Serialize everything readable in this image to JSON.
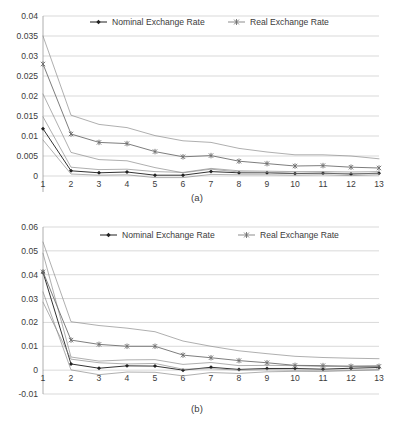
{
  "figure": {
    "caption_a": "(a)",
    "caption_b": "(b)"
  },
  "legend": {
    "nominal_label": "Nominal Exchange Rate",
    "real_label": "Real Exchange Rate",
    "nominal_marker": "diamond-marker-icon",
    "real_marker": "cross-marker-icon"
  },
  "colors": {
    "nominal": "#333333",
    "real": "#6e6e6e",
    "band": "#8d8d8d",
    "grid": "#c8c8c8",
    "axis": "#9a9a9a",
    "text": "#3b3b3b",
    "background": "#ffffff"
  },
  "chart_data": [
    {
      "type": "line",
      "panel": "a",
      "title": "",
      "xlabel": "",
      "ylabel": "",
      "grid": true,
      "legend_position": "top-center",
      "x": [
        1,
        2,
        3,
        4,
        5,
        6,
        7,
        8,
        9,
        10,
        11,
        12,
        13
      ],
      "xticks": [
        "1",
        "2",
        "3",
        "4",
        "5",
        "6",
        "7",
        "8",
        "9",
        "10",
        "11",
        "12",
        "13"
      ],
      "yticks": [
        "0.04",
        "0.035",
        "0.03",
        "0.025",
        "0.02",
        "0.015",
        "0.01",
        "0.005",
        "0",
        "-0.005"
      ],
      "ytick_values": [
        0.04,
        0.035,
        0.03,
        0.025,
        0.02,
        0.015,
        0.01,
        0.005,
        0,
        -0.005
      ],
      "ylim": [
        -0.005,
        0.04
      ],
      "xlim": [
        1,
        13
      ],
      "series": [
        {
          "name": "Nominal Exchange Rate",
          "marker": "diamond",
          "values": [
            0.0118,
            0.0013,
            0.0008,
            0.001,
            0.0002,
            0.0002,
            0.0011,
            0.0008,
            0.0008,
            0.0006,
            0.0007,
            0.0005,
            0.0007
          ]
        },
        {
          "name": "Nominal upper band",
          "marker": "none",
          "values": [
            0.0148,
            0.0022,
            0.0016,
            0.0017,
            0.0011,
            0.0009,
            0.0019,
            0.0013,
            0.0012,
            0.0011,
            0.0011,
            0.001,
            0.0011
          ]
        },
        {
          "name": "Nominal lower band",
          "marker": "none",
          "values": [
            0.009,
            0.0005,
            0.0002,
            0.0003,
            -0.0004,
            -0.0004,
            0.0004,
            0.0003,
            0.0003,
            0.0002,
            0.0003,
            0.0001,
            0.0003
          ]
        },
        {
          "name": "Real Exchange Rate",
          "marker": "cross",
          "values": [
            0.028,
            0.0105,
            0.0084,
            0.0081,
            0.0061,
            0.0048,
            0.0051,
            0.0037,
            0.0031,
            0.0025,
            0.0026,
            0.0022,
            0.002
          ]
        },
        {
          "name": "Real upper band",
          "marker": "none",
          "values": [
            0.035,
            0.0152,
            0.0129,
            0.0121,
            0.0101,
            0.0088,
            0.0084,
            0.0069,
            0.006,
            0.0053,
            0.0053,
            0.005,
            0.0043
          ]
        },
        {
          "name": "Real lower band",
          "marker": "none",
          "values": [
            0.0205,
            0.0059,
            0.0041,
            0.0038,
            0.0021,
            0.0008,
            0.0017,
            0.001,
            0.0009,
            0.0007,
            0.0007,
            0.0006,
            0.0006
          ]
        }
      ]
    },
    {
      "type": "line",
      "panel": "b",
      "title": "",
      "xlabel": "",
      "ylabel": "",
      "grid": true,
      "legend_position": "top-center",
      "x": [
        1,
        2,
        3,
        4,
        5,
        6,
        7,
        8,
        9,
        10,
        11,
        12,
        13
      ],
      "xticks": [
        "1",
        "2",
        "3",
        "4",
        "5",
        "6",
        "7",
        "8",
        "9",
        "10",
        "11",
        "12",
        "13"
      ],
      "yticks": [
        "0.06",
        "0.05",
        "0.04",
        "0.03",
        "0.02",
        "0.01",
        "0",
        "-0.01"
      ],
      "ytick_values": [
        0.06,
        0.05,
        0.04,
        0.03,
        0.02,
        0.01,
        0,
        -0.01
      ],
      "ylim": [
        -0.01,
        0.06
      ],
      "xlim": [
        1,
        13
      ],
      "series": [
        {
          "name": "Nominal Exchange Rate",
          "marker": "diamond",
          "values": [
            0.041,
            0.0026,
            0.0008,
            0.0018,
            0.0017,
            0.0,
            0.0012,
            0.0003,
            0.0007,
            0.0007,
            0.0004,
            0.0008,
            0.0011
          ]
        },
        {
          "name": "Nominal upper band",
          "marker": "none",
          "values": [
            0.049,
            0.0055,
            0.0038,
            0.0043,
            0.0044,
            0.0024,
            0.0032,
            0.0019,
            0.002,
            0.0019,
            0.0015,
            0.0017,
            0.0019
          ]
        },
        {
          "name": "Nominal lower band",
          "marker": "none",
          "values": [
            0.0328,
            0.0001,
            -0.0019,
            -0.0008,
            -0.0009,
            -0.0024,
            -0.001,
            -0.0014,
            -0.0007,
            -0.0005,
            -0.0006,
            -0.0002,
            0.0002
          ]
        },
        {
          "name": "Real Exchange Rate",
          "marker": "cross",
          "values": [
            0.0412,
            0.0126,
            0.0108,
            0.01,
            0.01,
            0.0063,
            0.0052,
            0.004,
            0.0031,
            0.002,
            0.0019,
            0.0016,
            0.0016
          ]
        },
        {
          "name": "Real upper band",
          "marker": "none",
          "values": [
            0.0537,
            0.0203,
            0.0187,
            0.0176,
            0.0161,
            0.0122,
            0.01,
            0.0081,
            0.0069,
            0.0058,
            0.0053,
            0.005,
            0.0048
          ]
        },
        {
          "name": "Real lower band",
          "marker": "none",
          "values": [
            0.0285,
            0.0046,
            0.0031,
            0.0026,
            0.0028,
            0.0004,
            0.0006,
            0.0,
            0.0002,
            0.0,
            0.0,
            0.0,
            0.0001
          ]
        }
      ]
    }
  ]
}
